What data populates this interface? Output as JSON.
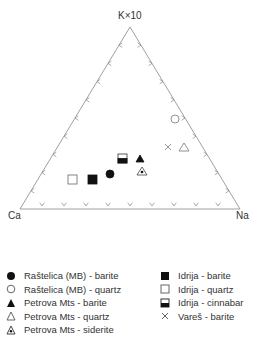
{
  "chart_data": {
    "type": "ternary",
    "title": "",
    "vertices": {
      "top": "K×10",
      "left": "Ca",
      "right": "Na"
    },
    "ticks_per_side": 10,
    "series": [
      {
        "name": "Raštelica (MB) - barite",
        "marker": "filled-circle",
        "points": [
          {
            "Ca": 0.45,
            "Na": 0.4,
            "K": 0.15
          }
        ]
      },
      {
        "name": "Raštelica (MB) - quartz",
        "marker": "open-circle",
        "points": [
          {
            "Ca": 0.1,
            "Na": 0.4,
            "K": 0.5
          }
        ]
      },
      {
        "name": "Petrova Mts - barite",
        "marker": "filled-triangle",
        "points": [
          {
            "Ca": 0.35,
            "Na": 0.37,
            "K": 0.28
          }
        ]
      },
      {
        "name": "Petrova Mts - quartz",
        "marker": "open-triangle",
        "points": [
          {
            "Ca": 0.1,
            "Na": 0.55,
            "K": 0.35
          }
        ]
      },
      {
        "name": "Petrova Mts - siderite",
        "marker": "dotted-triangle",
        "points": [
          {
            "Ca": 0.33,
            "Na": 0.45,
            "K": 0.22
          }
        ]
      },
      {
        "name": "Idrija - barite",
        "marker": "filled-square",
        "points": [
          {
            "Ca": 0.55,
            "Na": 0.3,
            "K": 0.15
          }
        ]
      },
      {
        "name": "Idrija - quartz",
        "marker": "open-square",
        "points": [
          {
            "Ca": 0.65,
            "Na": 0.2,
            "K": 0.15
          }
        ]
      },
      {
        "name": "Idrija - cinnabar",
        "marker": "half-square",
        "points": [
          {
            "Ca": 0.45,
            "Na": 0.27,
            "K": 0.28
          }
        ]
      },
      {
        "name": "Vareš - barite",
        "marker": "cross",
        "points": [
          {
            "Ca": 0.17,
            "Na": 0.48,
            "K": 0.35
          }
        ]
      }
    ]
  },
  "labels": {
    "top": "K×10",
    "left": "Ca",
    "right": "Na"
  },
  "legend": {
    "col1": [
      "Raštelica (MB) - barite",
      "Raštelica (MB) - quartz",
      "Petrova Mts - barite",
      "Petrova Mts - quartz",
      "Petrova Mts - siderite"
    ],
    "col2": [
      "Idrija - barite",
      "Idrija - quartz",
      "Idrija - cinnabar",
      "Vareš - barite"
    ]
  }
}
